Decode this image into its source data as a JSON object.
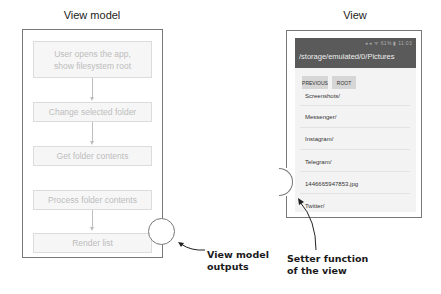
{
  "view_model": {
    "title": "View model",
    "steps": [
      {
        "line1": "User opens the app,",
        "line2": "show filesystem root"
      },
      {
        "label": "Change selected folder"
      },
      {
        "label": "Get folder contents"
      },
      {
        "label": "Process folder contents"
      },
      {
        "label": "Render list"
      }
    ],
    "output_label_line1": "View model",
    "output_label_line2": "outputs"
  },
  "view": {
    "title": "View",
    "status_bar": "◂◂ ᯤ 61% ▮ 11:03",
    "path": "/storage/emulated/0/Pictures",
    "buttons": {
      "previous": "PREVIOUS",
      "root": "ROOT"
    },
    "list_items": [
      "Screenshots/",
      "Messenger/",
      "Instagram/",
      "Telegram/",
      "1446665947853.jpg",
      "Twitter/"
    ],
    "setter_label_line1": "Setter function",
    "setter_label_line2": "of the view"
  },
  "colors": {
    "appbar": "#5a5a5a",
    "frame_border": "#777777",
    "step_text": "#bdbdbd"
  }
}
